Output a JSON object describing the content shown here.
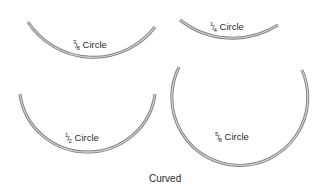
{
  "figure": {
    "caption": "Curved",
    "needles": [
      {
        "id": "three-eighths",
        "numerator": "3",
        "denominator": "8",
        "text": "Circle",
        "fraction_of_circle": 0.375
      },
      {
        "id": "one-quarter",
        "numerator": "1",
        "denominator": "4",
        "text": "Circle",
        "fraction_of_circle": 0.25
      },
      {
        "id": "one-half",
        "numerator": "1",
        "denominator": "2",
        "text": "Circle",
        "fraction_of_circle": 0.5
      },
      {
        "id": "five-eighths",
        "numerator": "5",
        "denominator": "8",
        "text": "Circle",
        "fraction_of_circle": 0.625
      }
    ],
    "colors": {
      "needle_dark": "#6e6e6e",
      "needle_light": "#c9c9c9",
      "text": "#2a2a2a"
    }
  }
}
